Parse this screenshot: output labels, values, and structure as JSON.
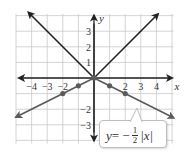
{
  "chart_data": {
    "type": "line",
    "title": "",
    "xlabel": "x",
    "ylabel": "y",
    "xlim": [
      -5,
      5
    ],
    "ylim": [
      -4,
      4
    ],
    "grid": true,
    "x_ticks": [
      -4,
      -3,
      -2,
      2,
      3,
      4
    ],
    "y_ticks": [
      3,
      2,
      1,
      -2,
      -3
    ],
    "x_tick_labels": [
      "−4",
      "−3",
      "−2",
      "2",
      "3",
      "4"
    ],
    "y_tick_labels": [
      "3",
      "2",
      "1",
      "−2",
      "−3"
    ],
    "series": [
      {
        "name": "y = |x|",
        "color": "#222222",
        "x": [
          -4,
          -3,
          -2,
          -1,
          0,
          1,
          2,
          3,
          4
        ],
        "y": [
          4,
          3,
          2,
          1,
          0,
          1,
          2,
          3,
          4
        ],
        "markers": false
      },
      {
        "name": "y = −1/2|x|",
        "color": "#5a5a5a",
        "x": [
          -5,
          -4,
          -3,
          -2,
          -1,
          0,
          1,
          2,
          3,
          4,
          5
        ],
        "y": [
          -2.5,
          -2,
          -1.5,
          -1,
          -0.5,
          0,
          -0.5,
          -1,
          -1.5,
          -2,
          -2.5
        ],
        "marker_points": [
          [
            -2,
            -1
          ],
          [
            -1,
            -0.5
          ],
          [
            0,
            0
          ],
          [
            1,
            -0.5
          ],
          [
            2,
            -1
          ]
        ],
        "markers": true
      }
    ],
    "annotations": [
      {
        "text": "y = −1/2|x|",
        "target_series": 1
      }
    ]
  },
  "equation_label": {
    "y": "y",
    "equals": " = −",
    "numerator": "1",
    "denominator": "2",
    "abs_expr": "|x|"
  }
}
